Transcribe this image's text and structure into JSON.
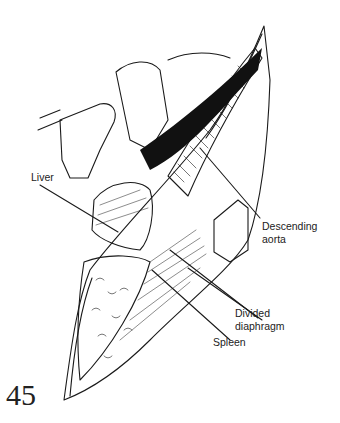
{
  "figure": {
    "number": "45",
    "labels": {
      "liver": "Liver",
      "descending_aorta_1": "Descending",
      "descending_aorta_2": "aorta",
      "divided_diaphragm_1": "Divided",
      "divided_diaphragm_2": "diaphragm",
      "spleen": "Spleen"
    }
  }
}
